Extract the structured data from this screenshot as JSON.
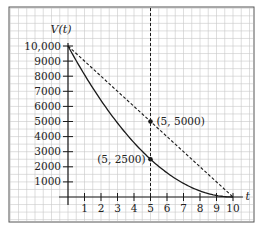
{
  "chart_data": {
    "type": "line",
    "title": "",
    "xlabel": "t",
    "ylabel": "V(t)",
    "xlim": [
      0,
      10
    ],
    "ylim": [
      0,
      10000
    ],
    "grid": true,
    "x_ticks": [
      1,
      2,
      3,
      4,
      5,
      6,
      7,
      8,
      9,
      10
    ],
    "y_ticks": [
      1000,
      2000,
      3000,
      4000,
      5000,
      6000,
      7000,
      8000,
      9000,
      10000
    ],
    "y_tick_labels": [
      "1000",
      "2000",
      "3000",
      "4000",
      "5000",
      "6000",
      "7000",
      "8000",
      "9000",
      "10,000"
    ],
    "series": [
      {
        "name": "curve",
        "style": "solid",
        "x": [
          0,
          1,
          2,
          3,
          4,
          5,
          6,
          7,
          8,
          9,
          10
        ],
        "values": [
          10000,
          8100,
          6400,
          4900,
          3600,
          2500,
          1600,
          900,
          400,
          100,
          0
        ]
      },
      {
        "name": "linear",
        "style": "dashed",
        "x": [
          0,
          10
        ],
        "values": [
          10000,
          0
        ]
      }
    ],
    "vertical_line": {
      "x": 5,
      "style": "dashed"
    },
    "annotations": [
      {
        "x": 5,
        "y": 5000,
        "label": "(5, 5000)",
        "position": "right"
      },
      {
        "x": 5,
        "y": 2500,
        "label": "(5, 2500)",
        "position": "left"
      }
    ]
  },
  "colors": {
    "line": "#1a1a1a",
    "grid": "#c8c8c8",
    "frame": "#555555"
  }
}
